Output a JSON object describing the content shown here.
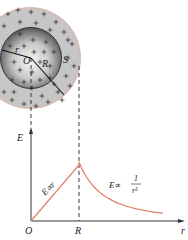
{
  "figure": {
    "sphere": {
      "inner_label_center": "O",
      "inner_radius_label": "r",
      "radius_label": "R",
      "surface_label": "S",
      "charge_symbol": "+"
    },
    "graph": {
      "y_axis_label": "E",
      "x_axis_label": "r",
      "origin_label": "O",
      "radius_tick_label": "R",
      "inside_relation": "E∝r",
      "outside_relation_prefix": "E∝",
      "outside_relation_num": "1",
      "outside_relation_den": "r²"
    },
    "colors": {
      "curve": "#e0836a",
      "outer_shell": "#c9c9c9",
      "outer_rim": "#d9b8ad",
      "inner_sphere_dark": "#5a5a5a",
      "inner_sphere_light": "#f4f4f4",
      "axis": "#333333"
    }
  },
  "chart_data": {
    "type": "line",
    "title": "",
    "xlabel": "r",
    "ylabel": "E",
    "x_tick_labels": [
      "O",
      "R"
    ],
    "series": [
      {
        "name": "E ∝ r (inside, r < R)",
        "x": [
          0,
          1
        ],
        "y": [
          0,
          1
        ]
      },
      {
        "name": "E ∝ 1/r² (outside, r > R)",
        "x": [
          1,
          1.25,
          1.5,
          1.75,
          2.0,
          2.25
        ],
        "y": [
          1,
          0.64,
          0.44,
          0.33,
          0.25,
          0.2
        ]
      }
    ],
    "annotations": [
      "E∝r",
      "E∝1/r²"
    ],
    "grid": false
  }
}
